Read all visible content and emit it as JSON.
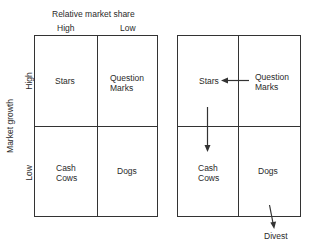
{
  "left_matrix": {
    "x_axis_title": "Relative market share",
    "x_labels": [
      "High",
      "Low"
    ],
    "y_axis_title": "Market growth",
    "y_labels": [
      "High",
      "Low"
    ],
    "quadrants": {
      "top_left": "Stars",
      "top_right_line1": "Question",
      "top_right_line2": "Marks",
      "bottom_left_line1": "Cash",
      "bottom_left_line2": "Cows",
      "bottom_right": "Dogs"
    }
  },
  "right_matrix": {
    "quadrants": {
      "top_left": "Stars",
      "top_right_line1": "Question",
      "top_right_line2": "Marks",
      "bottom_left_line1": "Cash",
      "bottom_left_line2": "Cows",
      "bottom_right": "Dogs"
    },
    "arrows": [
      {
        "from": "Question Marks",
        "to": "Stars"
      },
      {
        "from": "Stars",
        "to": "Cash Cows"
      },
      {
        "from": "Dogs",
        "to": "Divest"
      }
    ],
    "divest_label": "Divest"
  },
  "colors": {
    "line": "#333333",
    "text": "#2a2a2a",
    "background": "#ffffff"
  }
}
